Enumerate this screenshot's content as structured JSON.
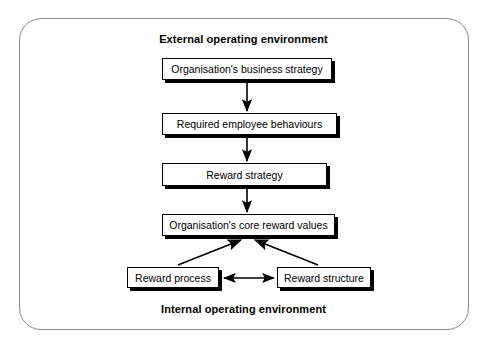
{
  "diagram": {
    "type": "flowchart",
    "title_top": "External operating environment",
    "title_bottom": "Internal operating environment",
    "frame": {
      "shape": "rounded-rectangle",
      "border_color": "#8c8c8c"
    },
    "style": {
      "node_fill": "#ffffff",
      "node_border": "#000000",
      "node_shadow": "#000000",
      "arrow_color": "#000000",
      "text_color": "#000000"
    },
    "nodes": [
      {
        "id": "business-strategy",
        "label": "Organisation's business strategy"
      },
      {
        "id": "employee-behaviours",
        "label": "Required employee behaviours"
      },
      {
        "id": "reward-strategy",
        "label": "Reward strategy"
      },
      {
        "id": "core-reward-values",
        "label": "Organisation's core reward values"
      },
      {
        "id": "reward-process",
        "label": "Reward process"
      },
      {
        "id": "reward-structure",
        "label": "Reward structure"
      }
    ],
    "edges": [
      {
        "from": "business-strategy",
        "to": "employee-behaviours",
        "direction": "down",
        "arrowheads": "end"
      },
      {
        "from": "employee-behaviours",
        "to": "reward-strategy",
        "direction": "down",
        "arrowheads": "end"
      },
      {
        "from": "reward-strategy",
        "to": "core-reward-values",
        "direction": "down",
        "arrowheads": "end"
      },
      {
        "from": "reward-process",
        "to": "core-reward-values",
        "direction": "diagonal-up",
        "arrowheads": "end"
      },
      {
        "from": "reward-structure",
        "to": "core-reward-values",
        "direction": "diagonal-up",
        "arrowheads": "end"
      },
      {
        "from": "reward-process",
        "to": "reward-structure",
        "direction": "horizontal",
        "arrowheads": "both"
      }
    ]
  }
}
